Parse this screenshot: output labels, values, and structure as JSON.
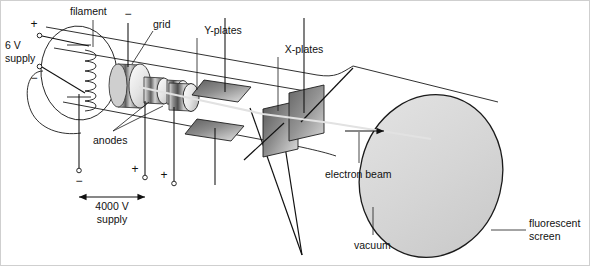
{
  "diagram": {
    "type": "technical-schematic"
  },
  "labels": {
    "supply_6v_line1": "6 V",
    "supply_6v_line2": "supply",
    "filament": "filament",
    "grid": "grid",
    "anodes": "anodes",
    "y_plates": "Y-plates",
    "x_plates": "X-plates",
    "supply_4000v_line1": "4000 V",
    "supply_4000v_line2": "supply",
    "electron_beam": "electron beam",
    "vacuum": "vacuum",
    "screen_line1": "fluorescent",
    "screen_line2": "screen"
  },
  "signs": {
    "supply_plus": "+",
    "supply_minus": "−",
    "grid_minus": "−",
    "cathode_minus": "−",
    "anode1_plus": "+",
    "anode2_plus": "+"
  },
  "colors": {
    "ink": "#111111",
    "outline": "#1a1a1a",
    "beam": "#e2e2e2",
    "screen_fill": "#d6d6d6",
    "plate_dark": "#6e6e6e",
    "plate_light": "#d8d8d8",
    "metal_light": "#f2f2f2",
    "metal_mid": "#9a9a9a",
    "metal_dark": "#5c5c5c",
    "page": "#ffffff"
  }
}
